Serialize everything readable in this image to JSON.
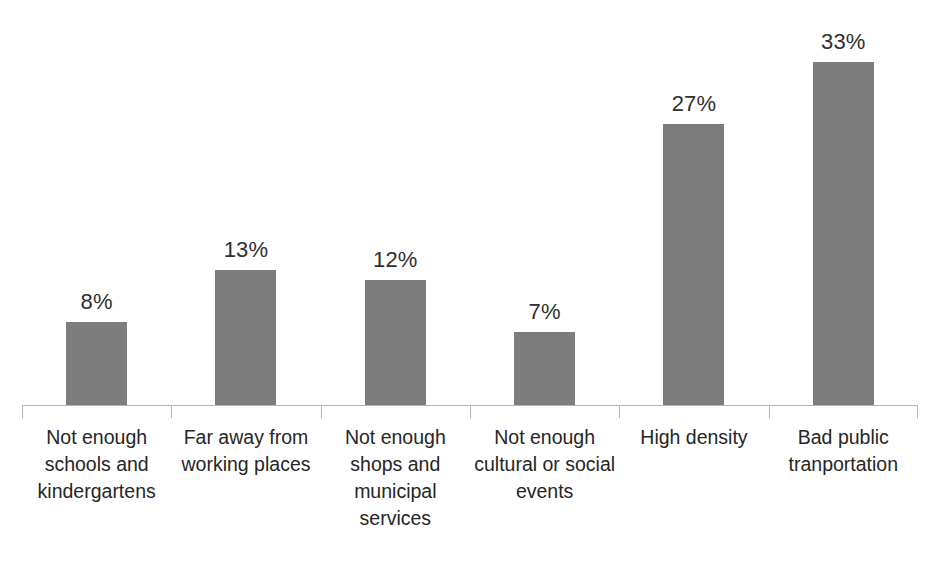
{
  "chart_data": {
    "type": "bar",
    "title": "",
    "subtitle": "",
    "xlabel": "",
    "ylabel": "",
    "categories": [
      "Not enough schools and kindergartens",
      "Far away from working places",
      "Not enough shops and municipal services",
      "Not enough cultural or social events",
      "High density",
      "Bad public tranportation"
    ],
    "values": [
      8,
      13,
      12,
      7,
      27,
      33
    ],
    "value_labels": [
      "8%",
      "13%",
      "12%",
      "7%",
      "27%",
      "33%"
    ],
    "ylim": [
      0,
      38
    ],
    "grid": false,
    "legend": false,
    "legend_position": "none",
    "orientation": "vertical",
    "bar_color": "#7d7d7d",
    "axis_color": "#b5b5b5",
    "label_color": "#262626",
    "value_label_color": "#2f2f2f",
    "series": [
      {
        "name": "Share of respondents",
        "values": [
          8,
          13,
          12,
          7,
          27,
          33
        ]
      }
    ],
    "annotations": []
  },
  "axis": {
    "tick_count": 7
  }
}
